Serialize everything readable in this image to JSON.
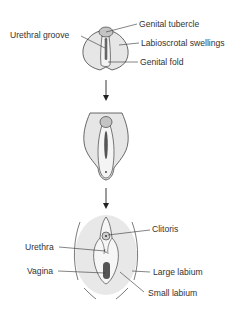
{
  "diagram": {
    "stages": [
      {
        "id": "indifferent",
        "labels": {
          "genital_tubercle": "Genital tubercle",
          "urethral_groove": "Urethral groove",
          "labioscrotal_swellings": "Labioscrotal swellings",
          "genital_fold": "Genital fold"
        }
      },
      {
        "id": "intermediate",
        "labels": {}
      },
      {
        "id": "adult",
        "labels": {
          "clitoris": "Clitoris",
          "urethra": "Urethra",
          "vagina": "Vagina",
          "large_labium": "Large labium",
          "small_labium": "Small labium"
        }
      }
    ],
    "arrows": [
      "down-arrow-1",
      "down-arrow-2"
    ],
    "colors": {
      "fill_light": "#e6e6e6",
      "fill_medium": "#c4c4c4",
      "fill_dark": "#555555",
      "outline": "#444444",
      "text": "#333333"
    }
  }
}
